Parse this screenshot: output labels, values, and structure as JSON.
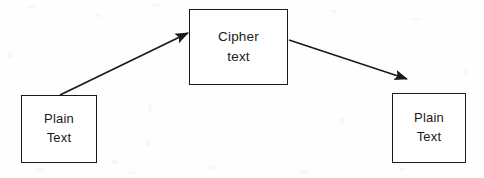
{
  "diagram": {
    "canvas": {
      "width": 484,
      "height": 178
    },
    "style": {
      "background_color": "#fefefe",
      "stroke_color": "#1a1a1a",
      "text_color": "#1a1a1a",
      "box_fill_color": "#ffffff",
      "stroke_width": 1.5
    },
    "nodes": [
      {
        "id": "plaintext-source",
        "label_line_1": "Plain",
        "label_line_2": "Text",
        "x": 21,
        "y": 95,
        "width": 76,
        "height": 68
      },
      {
        "id": "ciphertext",
        "label_line_1": "Cipher",
        "label_line_2": "text",
        "x": 189,
        "y": 9,
        "width": 99,
        "height": 76
      },
      {
        "id": "plaintext-result",
        "label_line_1": "Plain",
        "label_line_2": "Text",
        "x": 392,
        "y": 93,
        "width": 74,
        "height": 70
      }
    ],
    "edges": [
      {
        "id": "encrypt-arrow",
        "from": "plaintext-source",
        "to": "ciphertext",
        "label": "",
        "start_x": 60,
        "start_y": 95,
        "end_x": 188,
        "end_y": 33,
        "arrowhead": "end"
      },
      {
        "id": "decrypt-arrow",
        "from": "ciphertext",
        "to": "plaintext-result",
        "label": "",
        "start_x": 289,
        "start_y": 40,
        "end_x": 407,
        "end_y": 79,
        "arrowhead": "end"
      }
    ]
  }
}
